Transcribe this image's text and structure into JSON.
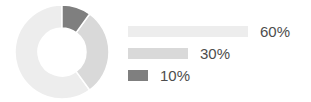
{
  "chart_data": {
    "type": "pie",
    "title": "",
    "subtitle": "",
    "xlabel": "",
    "ylabel": "",
    "grid": false,
    "legend_position": "right",
    "donut": true,
    "inner_radius_ratio": 0.5,
    "start_angle_deg": 0,
    "direction": "counterclockwise",
    "categories": [
      "60%",
      "30%",
      "10%"
    ],
    "values": [
      60,
      30,
      10
    ],
    "value_labels": [
      "60%",
      "30%",
      "10%"
    ],
    "colors": [
      "#ededed",
      "#d9d9d9",
      "#7f7f7f"
    ],
    "slices": [
      {
        "label": "60%",
        "value": 60,
        "color": "#ededed",
        "legend_bar_width_px": 120
      },
      {
        "label": "30%",
        "value": 30,
        "color": "#d9d9d9",
        "legend_bar_width_px": 60
      },
      {
        "label": "10%",
        "value": 10,
        "color": "#7f7f7f",
        "legend_bar_width_px": 20
      }
    ]
  },
  "donut": {
    "center_x": 48,
    "center_y": 48,
    "outer_radius": 47,
    "inner_radius": 24,
    "background": "#ffffff"
  },
  "legend": {
    "label_color": "#4d4d4d",
    "gap_px": 12
  },
  "theme": {
    "background": "#ffffff",
    "light_gray": "#ededed",
    "mid_gray": "#d9d9d9",
    "dark_gray": "#7f7f7f",
    "text_gray": "#4d4d4d"
  }
}
